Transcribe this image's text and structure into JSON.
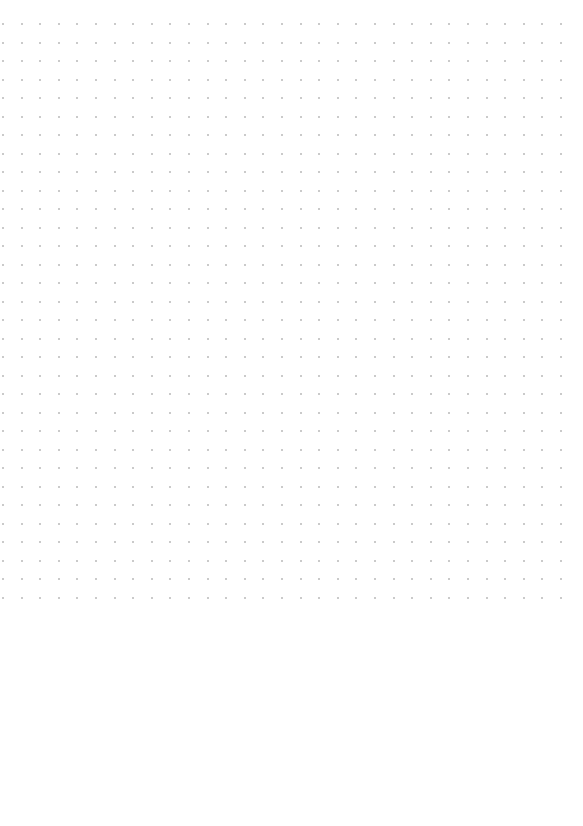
{
  "page": {
    "type": "dot-grid",
    "background_color": "#ffffff",
    "dot_color": "#b8b8b8",
    "grid": {
      "columns": 31,
      "rows": 32,
      "origin_x": 3,
      "origin_y": 24,
      "spacing_x": 18.6,
      "spacing_y": 18.5,
      "dot_size": 2
    }
  }
}
